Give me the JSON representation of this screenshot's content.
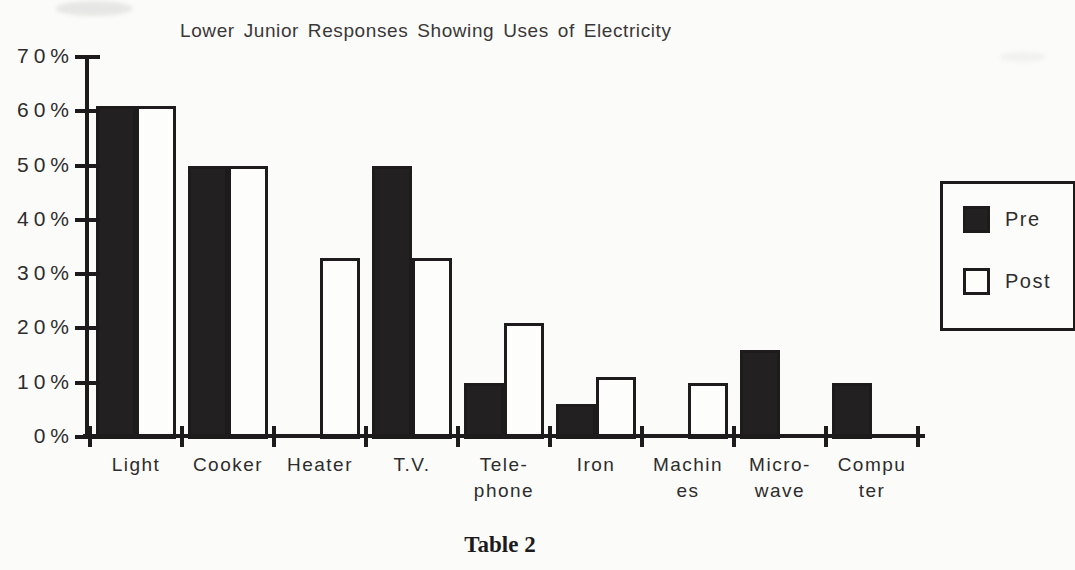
{
  "page": {
    "caption": "Table 2"
  },
  "chart_data": {
    "type": "bar",
    "title": "Lower Junior Responses Showing Uses of Electricity",
    "categories": [
      "Light",
      "Cooker",
      "Heater",
      "T.V.",
      "Telephone",
      "Iron",
      "Machines",
      "Micro-wave",
      "Computer"
    ],
    "category_labels": [
      {
        "line1": "Light",
        "line2": ""
      },
      {
        "line1": "Cooker",
        "line2": ""
      },
      {
        "line1": "Heater",
        "line2": ""
      },
      {
        "line1": "T.V.",
        "line2": ""
      },
      {
        "line1": "Tele-",
        "line2": "phone"
      },
      {
        "line1": "Iron",
        "line2": ""
      },
      {
        "line1": "Machin",
        "line2": "es"
      },
      {
        "line1": "Micro-",
        "line2": "wave"
      },
      {
        "line1": "Compu",
        "line2": "ter"
      }
    ],
    "series": [
      {
        "name": "Pre",
        "fill": "#232021",
        "values": [
          61,
          50,
          null,
          50,
          10,
          6,
          null,
          16,
          10
        ]
      },
      {
        "name": "Post",
        "fill": "#fdfdfc",
        "values": [
          61,
          50,
          33,
          33,
          21,
          11,
          10,
          null,
          null
        ]
      }
    ],
    "xlabel": "",
    "ylabel": "",
    "y_axis": {
      "min": 0,
      "max": 70,
      "step": 10,
      "unit": "%",
      "tick_labels": [
        "70%",
        "60%",
        "50%",
        "40%",
        "30%",
        "20%",
        "10%",
        "0%"
      ]
    },
    "grid": false,
    "legend_position": "right"
  },
  "colors": {
    "ink": "#1d1b1c",
    "paper": "#fbfbf9"
  }
}
